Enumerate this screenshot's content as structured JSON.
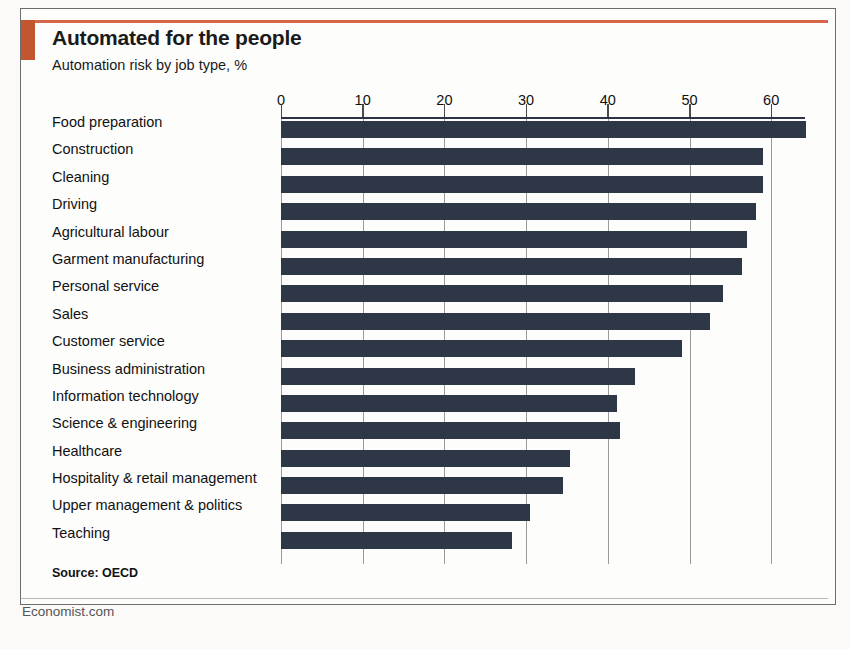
{
  "card": {
    "title": "Automated for the people",
    "subtitle": "Automation risk by job type, %",
    "source": "Source: OECD",
    "brand": "Economist.com",
    "accent_color": "#c2562f",
    "bar_color": "#2d3746",
    "grid_color": "#9b9b9b"
  },
  "chart_data": {
    "type": "bar",
    "orientation": "horizontal",
    "title": "Automated for the people",
    "subtitle": "Automation risk by job type, %",
    "xlabel": "",
    "ylabel": "",
    "xlim": [
      0,
      64
    ],
    "axis_position": "top",
    "grid": true,
    "legend": null,
    "ticks": [
      0,
      10,
      20,
      30,
      40,
      50,
      60
    ],
    "tick_labels": [
      "0",
      "10",
      "20",
      "30",
      "40",
      "50",
      "60"
    ],
    "categories": [
      "Food preparation",
      "Construction",
      "Cleaning",
      "Driving",
      "Agricultural labour",
      "Garment manufacturing",
      "Personal service",
      "Sales",
      "Customer service",
      "Business administration",
      "Information technology",
      "Science & engineering",
      "Healthcare",
      "Hospitality & retail management",
      "Upper management & politics",
      "Teaching"
    ],
    "values": [
      64.3,
      59,
      59,
      58.2,
      57,
      56.4,
      54.1,
      52.5,
      49.1,
      43.3,
      41.1,
      41.5,
      35.4,
      34.5,
      30.5,
      28.3
    ]
  }
}
